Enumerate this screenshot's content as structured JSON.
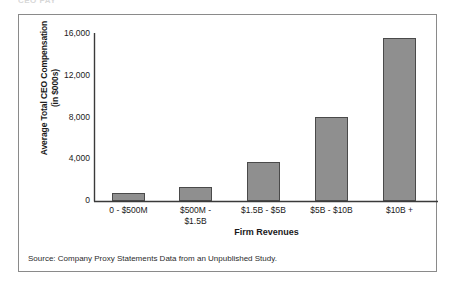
{
  "clipped_header": "CEO PAY",
  "figure": {
    "source_note": "Source: Company Proxy Statements Data from an Unpublished Study.",
    "frame_color": "#8a8a8a"
  },
  "chart_data": {
    "type": "bar",
    "title": "",
    "subtitle": "",
    "xlabel": "Firm Revenues",
    "ylabel": "Average Total CEO Compensation\n(in $000s)",
    "ylabel_line1": "Average Total CEO Compensation",
    "ylabel_line2": "(in $000s)",
    "categories": [
      "0 - $500M",
      "$500M -\n$1.5B",
      "$1.5B - $5B",
      "$5B - $10B",
      "$10B +"
    ],
    "values": [
      750,
      1350,
      3750,
      8050,
      15600
    ],
    "ylim": [
      0,
      16000
    ],
    "yticks": [
      0,
      4000,
      8000,
      12000,
      16000
    ],
    "ytick_labels": [
      "0",
      "4,000",
      "8,000",
      "12,000",
      "16,000"
    ],
    "grid": false,
    "legend": null,
    "bar_color": "#8f8f8f",
    "bar_edge_color": "#4a4a4a"
  }
}
